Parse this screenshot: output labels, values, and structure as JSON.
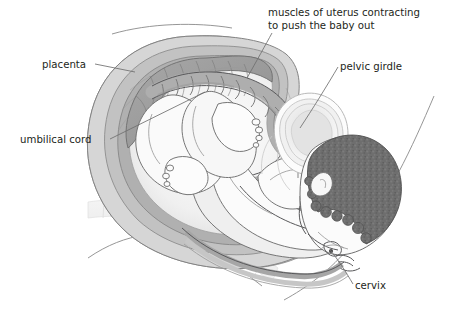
{
  "figure": {
    "type": "anatomical-illustration",
    "width": 450,
    "height": 326,
    "background_color": "#ffffff",
    "style": "grayscale line drawing with tonal shading"
  },
  "labels": [
    {
      "id": "muscles-of-uterus",
      "text_line_1": "muscles of uterus contracting",
      "text_line_2": "to push the baby out",
      "text_anchor": "start",
      "x": 268,
      "y": 16,
      "line_height": 13,
      "leader_from": [
        272,
        33
      ],
      "leader_to": [
        247,
        78
      ]
    },
    {
      "id": "pelvic-girdle",
      "text_line_1": "pelvic girdle",
      "text_anchor": "start",
      "x": 340,
      "y": 70,
      "leader_from": [
        338,
        67
      ],
      "leader_to": [
        300,
        128
      ]
    },
    {
      "id": "placenta",
      "text_line_1": "placenta",
      "text_anchor": "start",
      "x": 42,
      "y": 68,
      "leader_from": [
        95,
        64
      ],
      "leader_to": [
        135,
        72
      ]
    },
    {
      "id": "umbilical-cord",
      "text_line_1": "umbilical cord",
      "text_anchor": "start",
      "x": 20,
      "y": 143,
      "leader_from": [
        110,
        139
      ],
      "leader_to": [
        205,
        92
      ]
    },
    {
      "id": "cervix",
      "text_line_1": "cervix",
      "text_anchor": "start",
      "x": 355,
      "y": 289,
      "leader_from": [
        353,
        284
      ],
      "leader_to": [
        330,
        250
      ]
    }
  ],
  "palette": {
    "ink_dark": "#58585a",
    "ink_mid": "#8a8a8a",
    "ink_light": "#c9c9c9",
    "text": "#231f20",
    "uterus_wall_outer": "#d8d8d8",
    "uterus_wall_mid": "#bdbdbd",
    "uterus_wall_inner": "#a9a9a9",
    "placenta_fill": "#9e9e9e",
    "amniotic_fill": "#f2f2f2",
    "baby_skin": "#fbfbfb",
    "baby_shadow": "#e4e4e4",
    "hair_fill": "#6e6e6e",
    "cord_fill": "#b4b4b4",
    "cord_shadow": "#8f8f8f",
    "pelvis_outer": "#ededed",
    "pelvis_mid": "#dcdcdc",
    "pelvis_inner": "#cfcfcf",
    "spine_fill": "#ececec",
    "spine_edge": "#dadada"
  },
  "structures": [
    {
      "name": "uterus-wall",
      "description": "layered muscular wall surrounding the baby"
    },
    {
      "name": "placenta",
      "description": "dark gray mass on the upper-left inner uterine wall"
    },
    {
      "name": "umbilical-cord",
      "description": "twisted helical cord from placenta to baby's abdomen"
    },
    {
      "name": "fetus",
      "description": "baby in head-down vertex position"
    },
    {
      "name": "fetal-head",
      "description": "head with dark textured hair engaged in the pelvis"
    },
    {
      "name": "pelvic-girdle",
      "description": "concentric oval bone cross-section behind the head"
    },
    {
      "name": "cervix",
      "description": "opening at the lower uterus where the head emerges"
    },
    {
      "name": "maternal-spine",
      "description": "pale segmented vertebral column at lower left"
    },
    {
      "name": "maternal-body-outline",
      "description": "thin contour lines of the mother's abdomen and back"
    }
  ]
}
